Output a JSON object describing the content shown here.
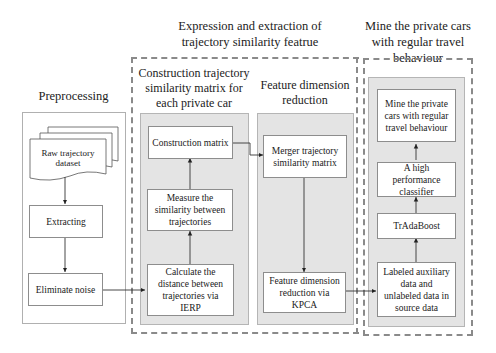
{
  "titles": {
    "preprocessing": "Preprocessing",
    "expression_group": "Expression and extraction of trajectory similarity featrue",
    "construction_panel": "Construction trajectory similarity matrix for each private car",
    "feature_panel": "Feature dimension reduction",
    "mine_group": "Mine the private cars with regular travel behaviour"
  },
  "preprocessing": {
    "dataset": "Raw trajectory dataset",
    "extracting": "Extracting",
    "eliminate_noise": "Eliminate noise"
  },
  "construction": {
    "construction_matrix": "Construction matrix",
    "measure_similarity": "Measure the similarity between trajectories",
    "calculate_distance": "Calculate the distance between trajectories via IERP"
  },
  "feature": {
    "merger_matrix": "Merger trajectory similarity matrix",
    "kpca": "Feature dimension reduction via KPCA"
  },
  "mine": {
    "result": "Mine the private cars with regular travel behaviour",
    "classifier": "A high performance classifier",
    "tradaboost": "TrAdaBoost",
    "labeled_data": "Labeled auxiliary data and unlabeled data in source data"
  }
}
